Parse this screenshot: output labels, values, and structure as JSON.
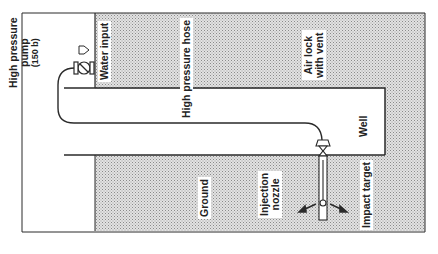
{
  "diagram": {
    "labels": {
      "pump_line1": "High pressure",
      "pump_line2": "pump",
      "pump_line3": "(150 b)",
      "water_input": "Water input",
      "hose": "High pressure hose",
      "air_lock_line1": "Air lock",
      "air_lock_line2": "with vent",
      "well": "Well",
      "ground": "Ground",
      "nozzle_line1": "Injection",
      "nozzle_line2": "nozzle",
      "impact_target": "Impact target"
    },
    "colors": {
      "line": "#2a2a2a",
      "hatch": "#c8c8c8",
      "background": "#ffffff"
    }
  }
}
